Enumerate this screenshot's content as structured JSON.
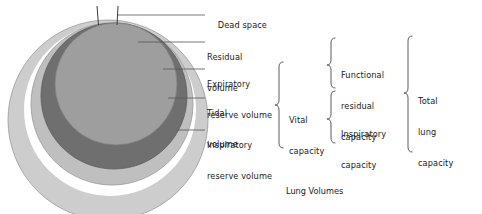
{
  "figure": {
    "caption": "Lung Volumes",
    "type": "nested-circle-diagram"
  },
  "colors": {
    "background": "#ffffff",
    "ink": "#1a1a1a",
    "leader_line": "#5a5a5a",
    "inspiratory_reserve_volume": "#c9c9c9",
    "expiratory_reserve_volume": "#bdbdbd",
    "tidal_volume": "#6e6e6e",
    "residual_volume": "#9c9c9c",
    "separator_ring": "#ffffff",
    "outline": "#8a8a8a"
  },
  "dead_space": {
    "label": "Dead space",
    "airway_left_x": 97,
    "airway_right_x": 118
  },
  "volume_labels": [
    {
      "id": "dead-space",
      "label": "Dead space",
      "line1": "Dead space",
      "line2": ""
    },
    {
      "id": "residual-volume",
      "label": "Residual volume",
      "line1": "Residual",
      "line2": "volume"
    },
    {
      "id": "expiratory-reserve-volume",
      "label": "Expiratory reserve volume",
      "line1": "Expiratory",
      "line2": "reserve volume"
    },
    {
      "id": "tidal-volume",
      "label": "Tidal volume",
      "line1": "Tidal",
      "line2": "volume"
    },
    {
      "id": "inspiratory-reserve-volume",
      "label": "Inspiratory reserve volume",
      "line1": "Inspiratory",
      "line2": "reserve volume"
    }
  ],
  "capacities": [
    {
      "id": "vital-capacity",
      "label": "Vital capacity",
      "line1": "Vital",
      "line2": "capacity",
      "line3": "",
      "column": 1,
      "groups": [
        "Expiratory reserve volume",
        "Tidal volume",
        "Inspiratory reserve volume"
      ]
    },
    {
      "id": "functional-residual-capacity",
      "label": "Functional residual capacity",
      "line1": "Functional",
      "line2": "residual",
      "line3": "capacity",
      "column": 2,
      "groups": [
        "Residual volume",
        "Expiratory reserve volume"
      ]
    },
    {
      "id": "inspiratory-capacity",
      "label": "Inspiratory capacity",
      "line1": "Inspiratory",
      "line2": "capacity",
      "line3": "",
      "column": 2,
      "groups": [
        "Tidal volume",
        "Inspiratory reserve volume"
      ]
    },
    {
      "id": "total-lung-capacity",
      "label": "Total lung capacity",
      "line1": "Total",
      "line2": "lung",
      "line3": "capacity",
      "column": 3,
      "groups": [
        "Residual volume",
        "Expiratory reserve volume",
        "Tidal volume",
        "Inspiratory reserve volume"
      ]
    }
  ]
}
